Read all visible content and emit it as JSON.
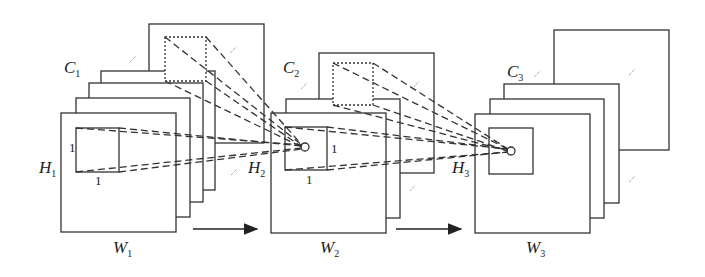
{
  "diagram": {
    "type": "cnn-feature-map-stacks",
    "stacks": [
      {
        "channel_label": "C",
        "channel_sub": "1",
        "height_label": "H",
        "height_sub": "1",
        "width_label": "W",
        "width_sub": "1",
        "kernel_h": "1",
        "kernel_w": "1"
      },
      {
        "channel_label": "C",
        "channel_sub": "2",
        "height_label": "H",
        "height_sub": "2",
        "width_label": "W",
        "width_sub": "2",
        "kernel_h": "1",
        "kernel_w": "1"
      },
      {
        "channel_label": "C",
        "channel_sub": "3",
        "height_label": "H",
        "height_sub": "3",
        "width_label": "W",
        "width_sub": "3"
      }
    ],
    "arrows": [
      "stack1-to-stack2",
      "stack2-to-stack3"
    ],
    "colors": {
      "line": "#333333",
      "background": "#ffffff"
    }
  }
}
